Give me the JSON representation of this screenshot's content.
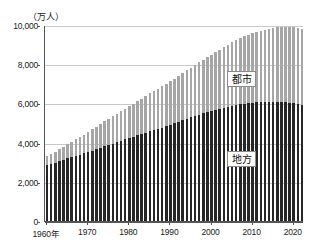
{
  "chart_data": {
    "type": "bar",
    "subtype": "stacked-bar",
    "title": "",
    "xlabel": "",
    "ylabel": "（万人）",
    "unit_label": "（万人）",
    "ylim": [
      0,
      10000
    ],
    "yticks": [
      0,
      2000,
      4000,
      6000,
      8000,
      10000
    ],
    "ytick_labels": [
      "0",
      "2,000",
      "4,000",
      "6,000",
      "8,000",
      "10,000"
    ],
    "xlim": [
      1959.5,
      2022.5
    ],
    "xticks": [
      1960,
      1970,
      1980,
      1990,
      2000,
      2010,
      2020
    ],
    "xtick_labels": [
      "1960年",
      "1970",
      "1980",
      "1990",
      "2000",
      "2010",
      "2020"
    ],
    "grid": "horizontal",
    "legend_position": "inside-right",
    "series": [
      {
        "name": "地方",
        "color": "#262626",
        "stack_order": 0,
        "values": [
          2850,
          2920,
          2980,
          3050,
          3120,
          3200,
          3260,
          3330,
          3390,
          3450,
          3510,
          3580,
          3650,
          3730,
          3810,
          3880,
          3950,
          4020,
          4090,
          4160,
          4230,
          4300,
          4370,
          4440,
          4510,
          4580,
          4640,
          4700,
          4760,
          4830,
          4900,
          4980,
          5060,
          5140,
          5220,
          5300,
          5370,
          5430,
          5490,
          5550,
          5610,
          5670,
          5730,
          5790,
          5840,
          5890,
          5930,
          5960,
          5990,
          6010,
          6030,
          6050,
          6060,
          6070,
          6080,
          6080,
          6080,
          6070,
          6060,
          6040,
          6010,
          5970,
          5930
        ]
      },
      {
        "name": "都市",
        "color": "#a6a6a6",
        "stack_order": 1,
        "values": [
          450,
          500,
          550,
          600,
          660,
          720,
          780,
          840,
          900,
          960,
          1030,
          1090,
          1150,
          1210,
          1270,
          1330,
          1390,
          1450,
          1510,
          1570,
          1630,
          1690,
          1750,
          1810,
          1870,
          1930,
          1990,
          2050,
          2110,
          2170,
          2230,
          2290,
          2350,
          2410,
          2470,
          2530,
          2600,
          2670,
          2740,
          2810,
          2880,
          2950,
          3020,
          3090,
          3160,
          3230,
          3300,
          3370,
          3440,
          3500,
          3560,
          3610,
          3660,
          3700,
          3740,
          3780,
          3810,
          3840,
          3860,
          3880,
          3890,
          3870,
          3850
        ]
      }
    ],
    "x": [
      1960,
      1961,
      1962,
      1963,
      1964,
      1965,
      1966,
      1967,
      1968,
      1969,
      1970,
      1971,
      1972,
      1973,
      1974,
      1975,
      1976,
      1977,
      1978,
      1979,
      1980,
      1981,
      1982,
      1983,
      1984,
      1985,
      1986,
      1987,
      1988,
      1989,
      1990,
      1991,
      1992,
      1993,
      1994,
      1995,
      1996,
      1997,
      1998,
      1999,
      2000,
      2001,
      2002,
      2003,
      2004,
      2005,
      2006,
      2007,
      2008,
      2009,
      2010,
      2011,
      2012,
      2013,
      2014,
      2015,
      2016,
      2017,
      2018,
      2019,
      2020,
      2021,
      2022
    ],
    "annotations": [
      {
        "text": "都市",
        "series": "都市"
      },
      {
        "text": "地方",
        "series": "地方"
      }
    ]
  }
}
